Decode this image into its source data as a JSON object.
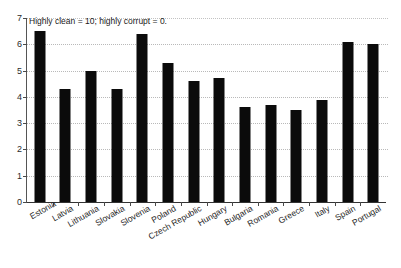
{
  "chart_data": {
    "type": "bar",
    "title": "",
    "subtitle": "",
    "xlabel": "",
    "ylabel": "",
    "ylim": [
      0,
      7
    ],
    "yticks": [
      0,
      1,
      2,
      3,
      4,
      5,
      6,
      7
    ],
    "grid": true,
    "legend": null,
    "annotations": [
      {
        "name": "scale-note",
        "text": "Highly clean = 10; highly corrupt = 0."
      }
    ],
    "categories": [
      "Estonia",
      "Latvia",
      "Lithuania",
      "Slovakia",
      "Slovenia",
      "Poland",
      "Czech Republic",
      "Hungary",
      "Bulgaria",
      "Romania",
      "Greece",
      "Italy",
      "Spain",
      "Portugal"
    ],
    "values": [
      6.5,
      4.3,
      5.0,
      4.3,
      6.4,
      5.3,
      4.6,
      4.7,
      3.6,
      3.7,
      3.5,
      3.9,
      6.1,
      6.0
    ],
    "bar_color": "#0b0b0b",
    "grid_color": "#b9b9b9",
    "background_color": "#ffffff",
    "axis_color": "#333333"
  }
}
